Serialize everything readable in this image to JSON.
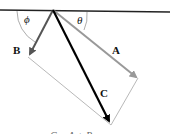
{
  "diagram": {
    "type": "vector-addition",
    "labels": {
      "A": "A",
      "B": "B",
      "C": "C",
      "phi": "ϕ",
      "theta": "θ"
    },
    "caption": "C = A + B ...",
    "colors": {
      "surface": "#222222",
      "vector_A": "#999999",
      "vector_B": "#555555",
      "vector_C": "#000000",
      "parallelogram": "#999999",
      "arc": "#888888"
    }
  }
}
